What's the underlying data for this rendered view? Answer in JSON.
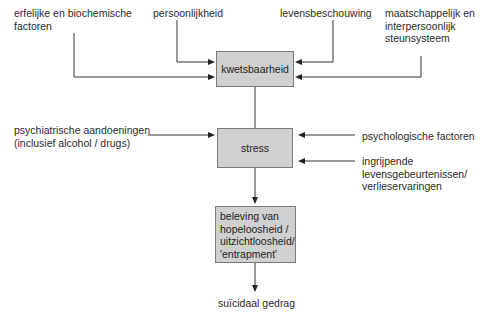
{
  "diagram": {
    "nodes": {
      "vulnerability": "kwetsbaarheid",
      "stress": "stress",
      "hopelessness": [
        "beleving van",
        "hopeloosheid /",
        "uitzichtloosheid/",
        "'entrapment'"
      ],
      "outcome": "suïcidaal gedrag"
    },
    "inputs_vulnerability": {
      "hereditary": [
        "erfelijke en biochemische",
        "factoren"
      ],
      "personality": "persoonlijkheid",
      "worldview": "levensbeschouwing",
      "support": [
        "maatschappelijk en",
        "interpersoonlijk",
        "steunsysteem"
      ]
    },
    "inputs_stress": {
      "psychiatric": [
        "psychiatrische aandoeningen",
        "(inclusief alcohol / drugs)"
      ],
      "psychological": "psychologische factoren",
      "life_events": [
        "ingrijpende",
        "levensgebeurtenissen/",
        "verlieservaringen"
      ]
    },
    "edges": [
      {
        "from": "erfelijke en biochemische factoren",
        "to": "kwetsbaarheid"
      },
      {
        "from": "persoonlijkheid",
        "to": "kwetsbaarheid"
      },
      {
        "from": "levensbeschouwing",
        "to": "kwetsbaarheid"
      },
      {
        "from": "maatschappelijk en interpersoonlijk steunsysteem",
        "to": "kwetsbaarheid"
      },
      {
        "from": "kwetsbaarheid",
        "to": "stress"
      },
      {
        "from": "psychiatrische aandoeningen (inclusief alcohol / drugs)",
        "to": "stress"
      },
      {
        "from": "psychologische factoren",
        "to": "stress"
      },
      {
        "from": "ingrijpende levensgebeurtenissen/verlieservaringen",
        "to": "stress"
      },
      {
        "from": "stress",
        "to": "beleving van hopeloosheid / uitzichtloosheid/ 'entrapment'"
      },
      {
        "from": "beleving van hopeloosheid / uitzichtloosheid/ 'entrapment'",
        "to": "suïcidaal gedrag"
      }
    ]
  }
}
